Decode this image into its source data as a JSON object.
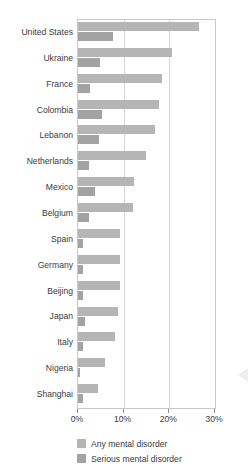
{
  "top_fragment": "·  ·",
  "chart_data": {
    "type": "bar",
    "orientation": "horizontal",
    "title": "",
    "subtitle": "",
    "xlabel": "",
    "ylabel": "",
    "xlim": [
      0,
      30
    ],
    "xticks": [
      0,
      10,
      20,
      30
    ],
    "xtick_labels": [
      "0%",
      "10%",
      "20%",
      "30%"
    ],
    "grid": "vertical",
    "legend_position": "bottom-left",
    "categories": [
      "United States",
      "Ukraine",
      "France",
      "Colombia",
      "Lebanon",
      "Netherlands",
      "Mexico",
      "Belgium",
      "Spain",
      "Germany",
      "Beijing",
      "Japan",
      "Italy",
      "Nigeria",
      "Shanghai"
    ],
    "series": [
      {
        "name": "Any mental disorder",
        "color": "#b5b5b5",
        "values": [
          26.4,
          20.5,
          18.4,
          17.8,
          16.9,
          14.9,
          12.2,
          12.0,
          9.2,
          9.1,
          9.1,
          8.8,
          8.2,
          6.0,
          4.3
        ]
      },
      {
        "name": "Serious mental disorder",
        "color": "#a3a3a3",
        "values": [
          7.7,
          4.8,
          2.7,
          5.2,
          4.6,
          2.3,
          3.7,
          2.4,
          1.0,
          1.2,
          1.1,
          1.5,
          1.0,
          0.4,
          1.1
        ]
      }
    ]
  },
  "legend": {
    "items": [
      {
        "label": "Any mental disorder",
        "color": "#b5b5b5"
      },
      {
        "label": "Serious mental disorder",
        "color": "#a3a3a3"
      }
    ]
  },
  "colors": {
    "any_mental_disorder": "#b5b5b5",
    "serious_mental_disorder": "#a3a3a3",
    "frame": "#c9c9c9",
    "gridline": "#d5d5d5",
    "text": "#3b3b3b",
    "background": "#ffffff"
  }
}
